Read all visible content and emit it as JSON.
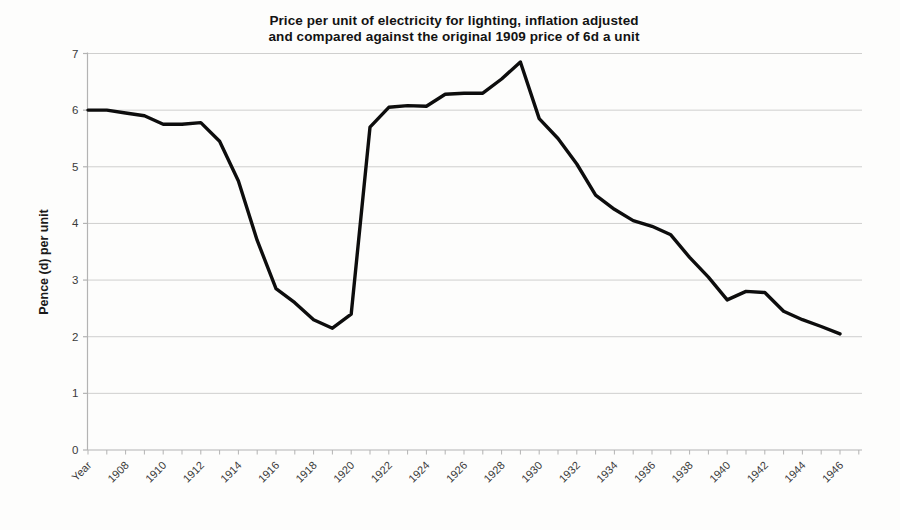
{
  "chart_data": {
    "type": "line",
    "title": "Price per unit of electricity for lighting, inflation adjusted and compared against the original 1909 price of 6d a unit",
    "title_lines": [
      "Price per unit of electricity for lighting, inflation adjusted",
      "and compared against the original 1909 price of 6d a unit"
    ],
    "ylabel": "Pence (d) per unit",
    "ylim": [
      0,
      7
    ],
    "y_ticks": [
      0,
      1,
      2,
      3,
      4,
      5,
      6,
      7
    ],
    "grid": "horizontal-on",
    "legend": "none",
    "x_label_interval": 2,
    "x_tick_labels_visible": [
      "Year",
      "1908",
      "1910",
      "1912",
      "1914",
      "1916",
      "1918",
      "1920",
      "1922",
      "1924",
      "1926",
      "1928",
      "1930",
      "1932",
      "1934",
      "1936",
      "1938",
      "1940",
      "1942",
      "1944",
      "1946"
    ],
    "categories": [
      "Year",
      "1907",
      "1908",
      "1909",
      "1910",
      "1911",
      "1912",
      "1913",
      "1914",
      "1915",
      "1916",
      "1917",
      "1918",
      "1919",
      "1920",
      "1921",
      "1922",
      "1923",
      "1924",
      "1925",
      "1926",
      "1927",
      "1928",
      "1929",
      "1930",
      "1931",
      "1932",
      "1933",
      "1934",
      "1935",
      "1936",
      "1937",
      "1938",
      "1939",
      "1940",
      "1941",
      "1942",
      "1943",
      "1944",
      "1945",
      "1946"
    ],
    "values": [
      6.0,
      6.0,
      5.95,
      5.9,
      5.75,
      5.75,
      5.78,
      5.45,
      4.75,
      3.7,
      2.85,
      2.6,
      2.3,
      2.15,
      2.4,
      5.7,
      6.05,
      6.08,
      6.07,
      6.28,
      6.3,
      6.3,
      6.55,
      6.85,
      5.85,
      5.5,
      5.05,
      4.5,
      4.25,
      4.05,
      3.95,
      3.8,
      3.4,
      3.05,
      2.65,
      2.8,
      2.78,
      2.45,
      2.3,
      2.18,
      2.05
    ],
    "colors": {
      "line": "#0d0d0d",
      "axis": "#b3b3b3",
      "grid": "#cfcfce",
      "tick_label": "#3a3a3a"
    }
  }
}
